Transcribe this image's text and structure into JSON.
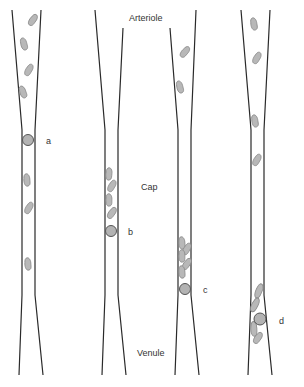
{
  "labels": {
    "arteriole": "Arteriole",
    "capillary": "Cap",
    "venule": "Venule"
  },
  "vessels": [
    {
      "id": "a",
      "label": "a",
      "description": "leukocyte flowing freely with red cells in vessel center"
    },
    {
      "id": "b",
      "label": "b",
      "description": "leukocyte followed by stacked red cells in capillary"
    },
    {
      "id": "c",
      "label": "c",
      "description": "leukocyte with accumulated red cells behind it"
    },
    {
      "id": "d",
      "label": "d",
      "description": "leukocyte at venule entrance surrounded by red cells"
    }
  ],
  "colors": {
    "wall": "#2a2a2a",
    "red_cell_fill": "#b8b8b8",
    "white_cell_fill": "#b3b3b3",
    "text": "#333333"
  }
}
